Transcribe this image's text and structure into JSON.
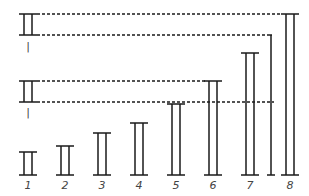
{
  "diagram": {
    "stroke_color": "#1a1a1a",
    "reference_units": [
      {
        "label": "|",
        "top": 14,
        "bottom": 35,
        "x_left": 19,
        "x_right": 37,
        "label_y": 50
      },
      {
        "label": "|",
        "top": 81,
        "bottom": 102,
        "x_left": 19,
        "x_right": 37,
        "label_y": 116
      }
    ],
    "bars": [
      {
        "label": "1",
        "cx": 28,
        "top": 152
      },
      {
        "label": "2",
        "cx": 65,
        "top": 146
      },
      {
        "label": "3",
        "cx": 102,
        "top": 133
      },
      {
        "label": "4",
        "cx": 139,
        "top": 123
      },
      {
        "label": "5",
        "cx": 176,
        "top": 104
      },
      {
        "label": "6",
        "cx": 213,
        "top": 81
      },
      {
        "label": "7",
        "cx": 250,
        "top": 53
      },
      {
        "label": "8",
        "cx": 290,
        "top": 14
      }
    ],
    "baseline_y": 175,
    "label_y": 189,
    "single_line": {
      "x": 271,
      "top": 35,
      "bottom": 175
    },
    "dashed_lines": [
      {
        "y": 14,
        "x1": 37,
        "x2": 281
      },
      {
        "y": 35,
        "x1": 37,
        "x2": 268
      },
      {
        "y": 81,
        "x1": 37,
        "x2": 205
      },
      {
        "y": 102,
        "x1": 37,
        "x2": 274
      }
    ]
  }
}
